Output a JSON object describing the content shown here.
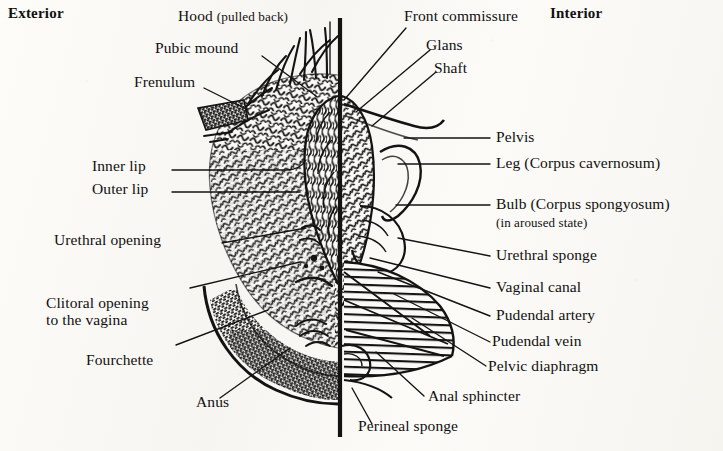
{
  "figure": {
    "ink_color": "#141312",
    "paper_color": "#fbfaf7",
    "midline": {
      "x": 340,
      "y_top": 18,
      "y_bottom": 437,
      "width": 4
    }
  },
  "headings": {
    "exterior": "Exterior",
    "interior": "Interior"
  },
  "labels": {
    "hood": "Hood",
    "hood_note": "(pulled back)",
    "pubic_mound": "Pubic mound",
    "frenulum": "Frenulum",
    "inner_lip": "Inner lip",
    "outer_lip": "Outer lip",
    "urethral_opening": "Urethral opening",
    "clitoral_opening_l1": "Clitoral opening",
    "clitoral_opening_l2": "to the vagina",
    "fourchette": "Fourchette",
    "anus": "Anus",
    "front_commissure": "Front commissure",
    "glans": "Glans",
    "shaft": "Shaft",
    "pelvis": "Pelvis",
    "leg": "Leg (Corpus cavernosum)",
    "bulb": "Bulb (Corpus spongyosum)",
    "bulb_note": "(in aroused state)",
    "urethral_sponge": "Urethral sponge",
    "vaginal_canal": "Vaginal canal",
    "pudendal_artery": "Pudendal artery",
    "pudendal_vein": "Pudendal vein",
    "pelvic_diaphragm": "Pelvic diaphragm",
    "anal_sphincter": "Anal sphincter",
    "perineal_sponge": "Perineal sponge"
  }
}
